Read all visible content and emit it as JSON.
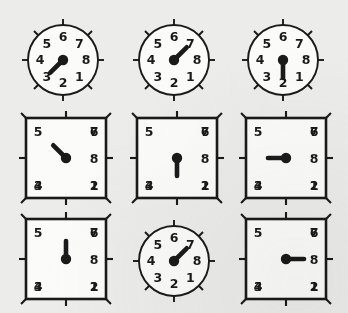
{
  "figure": {
    "background_color": "#ececeb",
    "ink_color": "#1a1a1a",
    "face_color": "#fbfbfa",
    "grid": {
      "rows": 3,
      "columns": 3
    },
    "dial_numbers": [
      "1",
      "2",
      "3",
      "4",
      "5",
      "6",
      "7",
      "8"
    ],
    "number_positions": {
      "6": "top",
      "7": "top-right",
      "8": "right",
      "1": "bottom-right",
      "2": "bottom",
      "3": "bottom-left",
      "4": "left",
      "5": "top-left"
    }
  },
  "cells": [
    {
      "index": 1,
      "row": 1,
      "column": 1,
      "shape": "circle",
      "hand_points_to": "1",
      "hand_angle_deg": 135,
      "labels": [
        "5",
        "6",
        "7",
        "4",
        "8",
        "3",
        "2",
        "1"
      ],
      "x": 16,
      "y": 8
    },
    {
      "index": 2,
      "row": 1,
      "column": 2,
      "shape": "circle",
      "hand_points_to": "7",
      "hand_angle_deg": 315,
      "labels": [
        "5",
        "6",
        "7",
        "4",
        "8",
        "3",
        "2",
        "1"
      ],
      "x": 127,
      "y": 8
    },
    {
      "index": 3,
      "row": 1,
      "column": 3,
      "shape": "circle",
      "hand_points_to": "2",
      "hand_angle_deg": 90,
      "labels": [
        "5",
        "6",
        "7",
        "4",
        "8",
        "3",
        "2",
        "1"
      ],
      "x": 236,
      "y": 8
    },
    {
      "index": 4,
      "row": 2,
      "column": 1,
      "shape": "square",
      "hand_points_to": "5",
      "hand_angle_deg": 225,
      "labels": [
        "5",
        "6",
        "7",
        "4",
        "8",
        "3",
        "2",
        "1"
      ],
      "x": 16,
      "y": 110
    },
    {
      "index": 5,
      "row": 2,
      "column": 2,
      "shape": "square",
      "hand_points_to": "2",
      "hand_angle_deg": 90,
      "labels": [
        "5",
        "6",
        "7",
        "4",
        "8",
        "3",
        "2",
        "1"
      ],
      "x": 127,
      "y": 110
    },
    {
      "index": 6,
      "row": 2,
      "column": 3,
      "shape": "square",
      "hand_points_to": "4",
      "hand_angle_deg": 180,
      "labels": [
        "5",
        "6",
        "7",
        "4",
        "8",
        "3",
        "2",
        "1"
      ],
      "x": 236,
      "y": 110
    },
    {
      "index": 7,
      "row": 3,
      "column": 1,
      "shape": "square",
      "hand_points_to": "6",
      "hand_angle_deg": 270,
      "labels": [
        "5",
        "6",
        "7",
        "4",
        "8",
        "3",
        "2",
        "1"
      ],
      "x": 16,
      "y": 211
    },
    {
      "index": 8,
      "row": 3,
      "column": 2,
      "shape": "circle",
      "hand_points_to": "7",
      "hand_angle_deg": 315,
      "labels": [
        "5",
        "6",
        "7",
        "4",
        "8",
        "3",
        "2",
        "1"
      ],
      "x": 127,
      "y": 209
    },
    {
      "index": 9,
      "row": 3,
      "column": 3,
      "shape": "square",
      "hand_points_to": "8",
      "hand_angle_deg": 0,
      "labels": [
        "5",
        "6",
        "7",
        "4",
        "8",
        "3",
        "2",
        "1"
      ],
      "x": 236,
      "y": 211
    }
  ]
}
